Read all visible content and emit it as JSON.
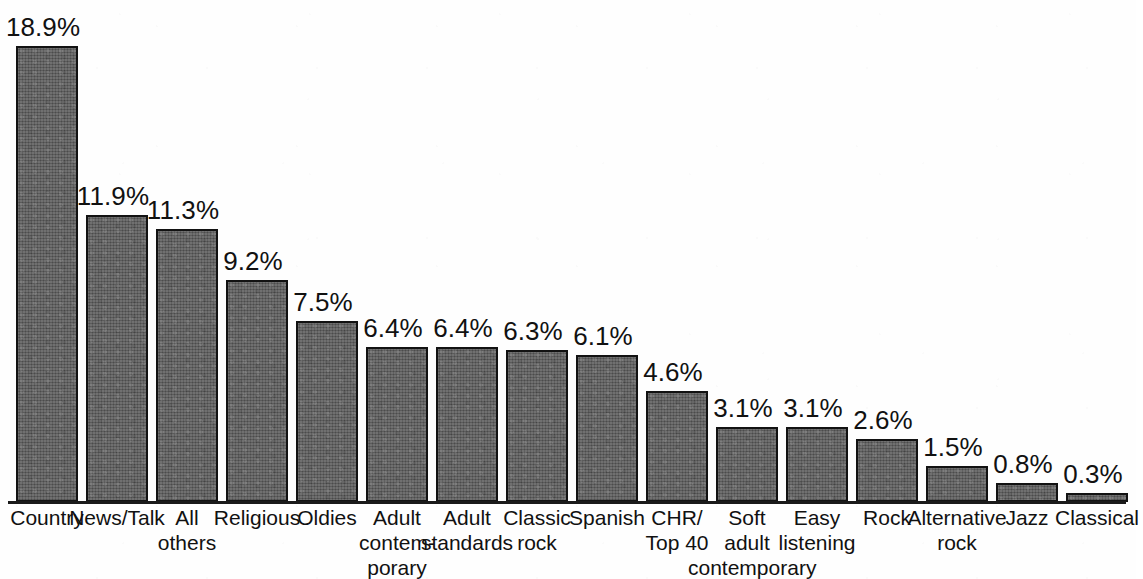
{
  "chart_data": {
    "type": "bar",
    "title": "",
    "subtitle": "",
    "xlabel": "",
    "ylabel": "",
    "ylim": [
      0,
      20
    ],
    "grid": false,
    "legend": false,
    "value_suffix": "%",
    "categories": [
      "Country",
      "News/Talk",
      "All others",
      "Religious",
      "Oldies",
      "Adult contemporary",
      "Adult standards",
      "Classic rock",
      "Spanish",
      "CHR/ Top 40",
      "Soft adult contemporary",
      "Easy listening",
      "Rock",
      "Alternative rock",
      "Jazz",
      "Classical"
    ],
    "category_lines": [
      [
        "Country"
      ],
      [
        "News/Talk"
      ],
      [
        "All",
        "others"
      ],
      [
        "Religious"
      ],
      [
        "Oldies"
      ],
      [
        "Adult",
        "contem-",
        "porary"
      ],
      [
        "Adult",
        "standards"
      ],
      [
        "Classic",
        "rock"
      ],
      [
        "Spanish"
      ],
      [
        "CHR/",
        "Top 40"
      ],
      [
        "Soft",
        "adult",
        "contemporary"
      ],
      [
        "Easy",
        "listening"
      ],
      [
        "Rock"
      ],
      [
        "Alternative",
        "rock"
      ],
      [
        "Jazz"
      ],
      [
        "Classical"
      ]
    ],
    "values": [
      18.9,
      11.9,
      11.3,
      9.2,
      7.5,
      6.4,
      6.4,
      6.3,
      6.1,
      4.6,
      3.1,
      3.1,
      2.6,
      1.5,
      0.8,
      0.3
    ],
    "value_labels": [
      "18.9%",
      "11.9%",
      "11.3%",
      "9.2%",
      "7.5%",
      "6.4%",
      "6.4%",
      "6.3%",
      "6.1%",
      "4.6%",
      "3.1%",
      "3.1%",
      "2.6%",
      "1.5%",
      "0.8%",
      "0.3%"
    ],
    "bar_color": "#565656",
    "bar_outline_color": "#121212",
    "axis_color": "#1a1a1a",
    "background_color": "#fefefe"
  }
}
